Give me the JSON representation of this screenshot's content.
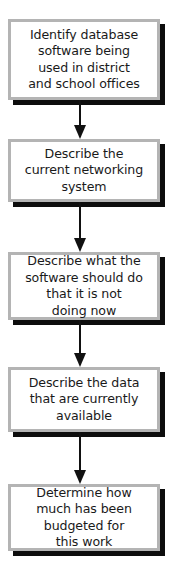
{
  "chart_data": {
    "type": "diagram",
    "diagram_type": "flowchart",
    "title": "",
    "orientation": "vertical",
    "node_shape": "rectangle",
    "connector_type": "arrow-down",
    "colors": {
      "node_fill": "#ffffff",
      "node_border": "#b4b4b4",
      "node_shadow": "#0d0d0d",
      "text": "#1a1a1a",
      "arrow": "#111111",
      "background": "#ffffff"
    },
    "nodes": [
      {
        "id": "node-1",
        "text": "Identify database\nsoftware being\nused in district\nand school offices",
        "lines": [
          "Identify database",
          "software being",
          "used in district",
          "and school offices"
        ],
        "x": 8,
        "y": 19,
        "width": 152,
        "height": 81
      },
      {
        "id": "node-2",
        "text": "Describe the\ncurrent networking\nsystem",
        "lines": [
          "Describe the",
          "current networking",
          "system"
        ],
        "x": 8,
        "y": 139,
        "width": 152,
        "height": 63
      },
      {
        "id": "node-3",
        "text": "Describe what the\nsoftware should do\nthat it is not\ndoing now",
        "lines": [
          "Describe what the",
          "software should do",
          "that it is not",
          "doing now"
        ],
        "x": 8,
        "y": 252,
        "width": 152,
        "height": 68
      },
      {
        "id": "node-4",
        "text": "Describe the data\nthat are currently\navailable",
        "lines": [
          "Describe the data",
          "that are currently",
          "available"
        ],
        "x": 8,
        "y": 367,
        "width": 152,
        "height": 65
      },
      {
        "id": "node-5",
        "text": "Determine how\nmuch has been\nbudgeted for\nthis work",
        "lines": [
          "Determine how",
          "much has been",
          "budgeted for",
          "this work"
        ],
        "x": 8,
        "y": 484,
        "width": 152,
        "height": 67
      }
    ],
    "edges": [
      {
        "id": "edge-1",
        "from": "node-1",
        "to": "node-2",
        "x": 80,
        "y": 100,
        "length": 39
      },
      {
        "id": "edge-2",
        "from": "node-2",
        "to": "node-3",
        "x": 80,
        "y": 202,
        "length": 50
      },
      {
        "id": "edge-3",
        "from": "node-3",
        "to": "node-4",
        "x": 80,
        "y": 320,
        "length": 47
      },
      {
        "id": "edge-4",
        "from": "node-4",
        "to": "node-5",
        "x": 80,
        "y": 432,
        "length": 52
      }
    ]
  },
  "nodes": {
    "node_1_label": "Identify database\nsoftware being\nused in district\nand school offices",
    "node_2_label": "Describe the\ncurrent networking\nsystem",
    "node_3_label": "Describe what the\nsoftware should do\nthat it is not\ndoing now",
    "node_4_label": "Describe the data\nthat are currently\navailable",
    "node_5_label": "Determine how\nmuch has been\nbudgeted for\nthis work"
  }
}
